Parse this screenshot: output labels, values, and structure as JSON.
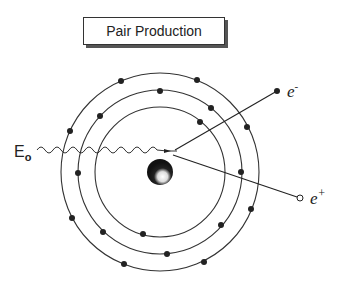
{
  "title": "Pair Production",
  "labels": {
    "photon_energy": "E",
    "photon_energy_sub": "o",
    "electron": "e",
    "electron_sup": "-",
    "positron": "e",
    "positron_sup": "+"
  },
  "atom": {
    "center": [
      160,
      172
    ],
    "nucleus_radius": 13,
    "shells": [
      {
        "name": "inner",
        "radius": 65
      },
      {
        "name": "middle",
        "radius": 82
      },
      {
        "name": "outer",
        "radius": 99
      }
    ],
    "colors": {
      "line": "#333333",
      "electron": "#222222",
      "nucleus": "#1a1a1a"
    }
  }
}
